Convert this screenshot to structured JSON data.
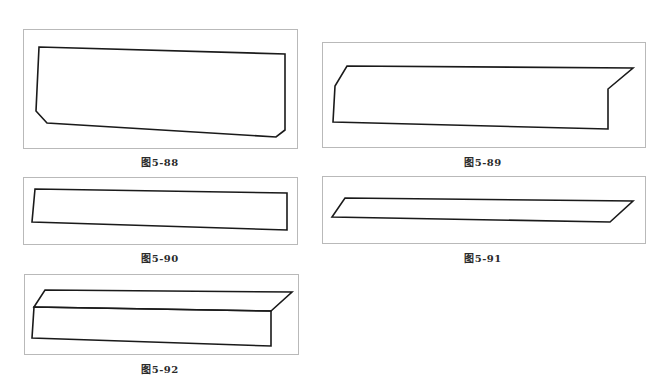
{
  "page": {
    "background": "#ffffff",
    "frame_border_color": "#b9b9b9",
    "stroke_color": "#1a1a1a"
  },
  "figures": [
    {
      "id": "fig-5-88",
      "caption": "图5-88",
      "frame": {
        "x": 23,
        "y": 29,
        "w": 275,
        "h": 120
      },
      "caption_pos": {
        "x": 120,
        "y": 154
      },
      "polygons": [
        [
          [
            39,
            47
          ],
          [
            285,
            54
          ],
          [
            285,
            130
          ],
          [
            276,
            137
          ],
          [
            47,
            123
          ],
          [
            36,
            111
          ]
        ]
      ]
    },
    {
      "id": "fig-5-89",
      "caption": "图5-89",
      "frame": {
        "x": 322,
        "y": 42,
        "w": 324,
        "h": 106
      },
      "caption_pos": {
        "x": 443,
        "y": 154
      },
      "polygons": [
        [
          [
            347,
            66
          ],
          [
            633,
            68
          ],
          [
            608,
            89
          ],
          [
            608,
            129
          ],
          [
            333,
            122
          ],
          [
            335,
            86
          ]
        ]
      ]
    },
    {
      "id": "fig-5-90",
      "caption": "图5-90",
      "frame": {
        "x": 23,
        "y": 177,
        "w": 275,
        "h": 68
      },
      "caption_pos": {
        "x": 120,
        "y": 250
      },
      "polygons": [
        [
          [
            35,
            189
          ],
          [
            287,
            193
          ],
          [
            287,
            230
          ],
          [
            32,
            222
          ]
        ]
      ]
    },
    {
      "id": "fig-5-91",
      "caption": "图5-91",
      "frame": {
        "x": 322,
        "y": 176,
        "w": 324,
        "h": 68
      },
      "caption_pos": {
        "x": 443,
        "y": 250
      },
      "polygons": [
        [
          [
            345,
            198
          ],
          [
            633,
            201
          ],
          [
            610,
            222
          ],
          [
            332,
            217
          ]
        ]
      ]
    },
    {
      "id": "fig-5-92",
      "caption": "图5-92",
      "frame": {
        "x": 24,
        "y": 274,
        "w": 275,
        "h": 81
      },
      "caption_pos": {
        "x": 120,
        "y": 361
      },
      "polygons": [
        [
          [
            45,
            290
          ],
          [
            292,
            292
          ],
          [
            271,
            311
          ],
          [
            34,
            307
          ]
        ],
        [
          [
            34,
            307
          ],
          [
            271,
            311
          ],
          [
            271,
            346
          ],
          [
            32,
            338
          ]
        ]
      ]
    }
  ]
}
